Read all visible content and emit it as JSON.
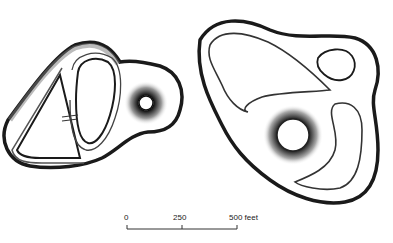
{
  "diagram": {
    "type": "earthwork plan",
    "figures": [
      {
        "name": "left-earthwork",
        "description": "triangular enclosure with oval inner loop and circular mound/pit"
      },
      {
        "name": "right-earthwork",
        "description": "large rounded enclosure with small loop and central circular pit"
      }
    ]
  },
  "scale_bar": {
    "labels": [
      "0",
      "250",
      "500 feet"
    ],
    "unit": "feet",
    "ticks": [
      0,
      250,
      500
    ]
  },
  "colors": {
    "ink": "#1a1a1a",
    "background": "#ffffff"
  }
}
